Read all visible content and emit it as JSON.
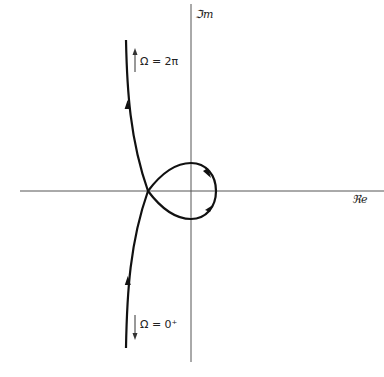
{
  "diagram": {
    "type": "nyquist-plot",
    "axes": {
      "real_label": "ℜe",
      "imag_label": "ℑm"
    },
    "annotations": {
      "top_label": "Ω = 2π",
      "bottom_label": "Ω = 0⁺"
    },
    "colors": {
      "curve": "#111111",
      "axis": "#555555",
      "background": "#ffffff"
    }
  }
}
